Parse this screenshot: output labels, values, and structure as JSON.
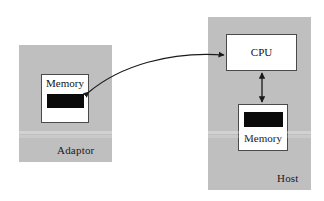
{
  "figure": {
    "type": "block-diagram",
    "background_color": "#ffffff",
    "enclosure_color": "#bfbfbf",
    "box_fill_color": "#ffffff",
    "box_border_color": "#4a4a4a",
    "bar_color": "#0a0a0a",
    "arrow_color": "#1a1a1a"
  },
  "adaptor": {
    "label": "Adaptor",
    "memory": {
      "label": "Memory",
      "label_position": "above-bar"
    }
  },
  "host": {
    "label": "Host",
    "cpu": {
      "label": "CPU"
    },
    "memory": {
      "label": "Memory",
      "label_position": "below-bar"
    }
  },
  "connections": {
    "adaptor_memory_to_cpu": {
      "style": "curved",
      "arrowheads": "both"
    },
    "cpu_to_host_memory": {
      "style": "straight-vertical",
      "arrowheads": "both"
    }
  }
}
